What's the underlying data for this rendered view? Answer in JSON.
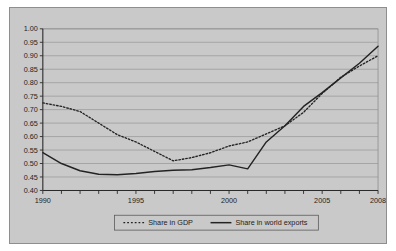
{
  "chart_data": {
    "type": "line",
    "title": "",
    "subtitle": "",
    "xlabel": "",
    "ylabel": "",
    "xlim": [
      1990,
      2008
    ],
    "ylim": [
      0.4,
      1.0
    ],
    "grid": true,
    "legend_position": "bottom",
    "x": [
      1990,
      1991,
      1992,
      1993,
      1994,
      1995,
      1996,
      1997,
      1998,
      1999,
      2000,
      2001,
      2002,
      2003,
      2004,
      2005,
      2006,
      2007,
      2008
    ],
    "xticks": [
      1990,
      1991,
      1992,
      1993,
      1994,
      1995,
      1996,
      1997,
      1998,
      1999,
      2000,
      2001,
      2002,
      2003,
      2004,
      2005,
      2006,
      2007,
      2008
    ],
    "xtick_labels": [
      "1990",
      "",
      "",
      "",
      "",
      "1995",
      "",
      "",
      "",
      "",
      "2000",
      "",
      "",
      "",
      "",
      "2005",
      "",
      "",
      "2008"
    ],
    "yticks": [
      0.4,
      0.45,
      0.5,
      0.55,
      0.6,
      0.65,
      0.7,
      0.75,
      0.8,
      0.85,
      0.9,
      0.95,
      1.0
    ],
    "ytick_labels": [
      "0.40",
      "0.45",
      "0.50",
      "0.55",
      "0.60",
      "0.65",
      "0.70",
      "0.75",
      "0.80",
      "0.85",
      "0.90",
      "0.95",
      "1.00"
    ],
    "series": [
      {
        "name": "Share in GDP",
        "style": "dashed",
        "color": "#232323",
        "values": [
          0.725,
          0.712,
          0.693,
          0.65,
          0.607,
          0.58,
          0.545,
          0.51,
          0.522,
          0.54,
          0.565,
          0.58,
          0.583,
          0.575,
          0.573,
          0.578,
          0.587,
          0.595,
          0.602
        ]
      },
      {
        "name": "Share in world exports",
        "style": "solid",
        "color": "#232323",
        "values": [
          0.54,
          0.5,
          0.473,
          0.46,
          0.458,
          0.463,
          0.47,
          0.475,
          0.477,
          0.485,
          0.495,
          0.48,
          0.468,
          0.456,
          0.487,
          0.512,
          0.535,
          0.555,
          0.572
        ]
      }
    ],
    "series_tail": {
      "note": "values continue to 2008",
      "Share in GDP": [
        0.61,
        0.64,
        0.69,
        0.76,
        0.82,
        0.862,
        0.9
      ],
      "Share in world exports": [
        0.58,
        0.64,
        0.712,
        0.763,
        0.818,
        0.872,
        0.935
      ]
    }
  },
  "legend": {
    "entries": [
      {
        "label": "Share in GDP",
        "style": "dashed"
      },
      {
        "label": "Share in world exports",
        "style": "solid"
      }
    ]
  },
  "colors": {
    "background": "#c9c9c9",
    "page": "#ffffff",
    "ink": "#232323",
    "grid": "#8d8d8d",
    "border": "#8e8e8e"
  }
}
